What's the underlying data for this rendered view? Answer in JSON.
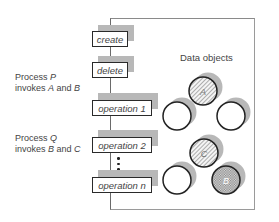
{
  "diagram": {
    "title": "Data objects",
    "processes": [
      {
        "line1": "Process ",
        "name": "P",
        "line2_prefix": "invokes ",
        "obj1": "A",
        "and": " and ",
        "obj2": "B"
      },
      {
        "line1": "Process ",
        "name": "Q",
        "line2_prefix": "invokes ",
        "obj1": "B",
        "and": " and ",
        "obj2": "C"
      }
    ],
    "operations": [
      {
        "label": "create"
      },
      {
        "label": "delete"
      },
      {
        "label": "operation 1"
      },
      {
        "label": "operation 2"
      },
      {
        "label": "operation n"
      }
    ],
    "objects": [
      {
        "label": "A",
        "fill": "hatched"
      },
      {
        "label": "",
        "fill": "empty"
      },
      {
        "label": "",
        "fill": "empty"
      },
      {
        "label": "C",
        "fill": "hatched"
      },
      {
        "label": "",
        "fill": "empty"
      },
      {
        "label": "B",
        "fill": "crosshatched"
      }
    ],
    "colors": {
      "border": "#2a2a2a",
      "shadow": "#b8b8b8",
      "frame": "#8a8a8a"
    }
  }
}
